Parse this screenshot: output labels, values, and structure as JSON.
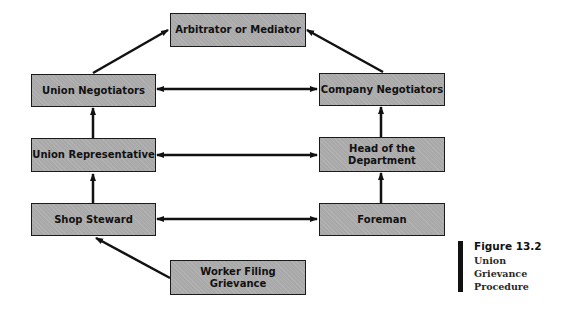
{
  "diagram": {
    "nodes": {
      "arbitrator": "Arbitrator or Mediator",
      "union_negotiators": "Union Negotiators",
      "company_negotiators": "Company Negotiators",
      "union_representative": "Union Representative",
      "head_of_department": "Head of the\nDepartment",
      "shop_steward": "Shop Steward",
      "foreman": "Foreman",
      "worker": "Worker Filing\nGrievance"
    },
    "edges": [
      {
        "from": "worker",
        "to": "shop_steward",
        "type": "directed"
      },
      {
        "from": "shop_steward",
        "to": "union_representative",
        "type": "directed"
      },
      {
        "from": "union_representative",
        "to": "union_negotiators",
        "type": "directed"
      },
      {
        "from": "union_negotiators",
        "to": "arbitrator",
        "type": "directed"
      },
      {
        "from": "foreman",
        "to": "head_of_department",
        "type": "directed"
      },
      {
        "from": "head_of_department",
        "to": "company_negotiators",
        "type": "directed"
      },
      {
        "from": "company_negotiators",
        "to": "arbitrator",
        "type": "directed"
      },
      {
        "from": "shop_steward",
        "to": "foreman",
        "type": "bidirectional"
      },
      {
        "from": "union_representative",
        "to": "head_of_department",
        "type": "bidirectional"
      },
      {
        "from": "union_negotiators",
        "to": "company_negotiators",
        "type": "bidirectional"
      }
    ],
    "colors": {
      "box_fill": "#a9a9a9",
      "box_border": "#1a1a1a",
      "arrow": "#111111"
    }
  },
  "caption": {
    "title": "Figure 13.2",
    "lines": [
      "Union",
      "Grievance",
      "Procedure"
    ]
  }
}
